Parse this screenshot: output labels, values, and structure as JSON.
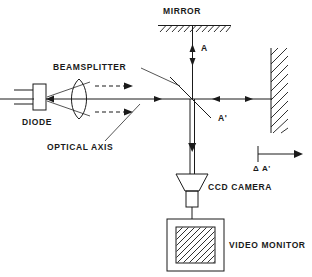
{
  "diagram": {
    "background_color": "#ffffff",
    "line_color": "#1a1a1a",
    "labels": {
      "mirror": "MIRROR",
      "beamsplitter": "BEAMSPLITTER",
      "diode": "DIODE",
      "optical_axis": "OPTICAL AXIS",
      "ccd_camera": "CCD CAMERA",
      "video_monitor": "VIDEO MONITOR",
      "beam_a": "A",
      "beam_a_prime": "A'",
      "delta_a_prime": "Δ A'"
    },
    "components": [
      {
        "name": "diode",
        "label": "DIODE",
        "shape": "rectangle-with-leads",
        "x": 33,
        "y": 84,
        "width": 13,
        "height": 26
      },
      {
        "name": "lens",
        "label": "",
        "shape": "biconvex-lens",
        "x": 68,
        "y": 80,
        "width": 22,
        "height": 42
      },
      {
        "name": "beamsplitter",
        "label": "BEAMSPLITTER",
        "shape": "diagonal-line-45deg",
        "x": 168,
        "y": 76,
        "width": 42,
        "height": 42
      },
      {
        "name": "mirror",
        "label": "MIRROR",
        "shape": "hatched-horizontal-bar",
        "x": 158,
        "y": 19,
        "width": 72,
        "height": 8
      },
      {
        "name": "target-wall",
        "label": "",
        "shape": "hatched-vertical-wall",
        "x": 271,
        "y": 48,
        "width": 16,
        "height": 84
      },
      {
        "name": "ccd-camera",
        "label": "CCD CAMERA",
        "shape": "trapezoid-with-body",
        "x": 175,
        "y": 172,
        "width": 32,
        "height": 32
      },
      {
        "name": "video-monitor",
        "label": "VIDEO MONITOR",
        "shape": "rectangle-with-hatched-screen",
        "x": 167,
        "y": 219,
        "width": 57,
        "height": 52
      }
    ],
    "beam_annotations": [
      {
        "name": "beam-a",
        "label": "A",
        "orientation": "vertical",
        "x": 203,
        "y": 48
      },
      {
        "name": "beam-a-prime",
        "label": "A'",
        "orientation": "horizontal",
        "x": 224,
        "y": 117
      },
      {
        "name": "delta-a-prime",
        "label": "Δ A'",
        "orientation": "horizontal",
        "x": 265,
        "y": 166
      }
    ]
  }
}
